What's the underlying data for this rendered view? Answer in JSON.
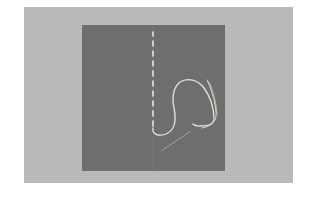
{
  "scene": {
    "description": "Square of gray fabric on a light gray background with a vertical line of white running stitches ending in a loop of thread and a needle",
    "colors": {
      "page": "#ffffff",
      "background": "#b9b9b9",
      "fabric": "#6e6e6e",
      "fold_line": "#747474",
      "thread": "#e8e4d8",
      "needle": "#9a9a9a"
    }
  }
}
